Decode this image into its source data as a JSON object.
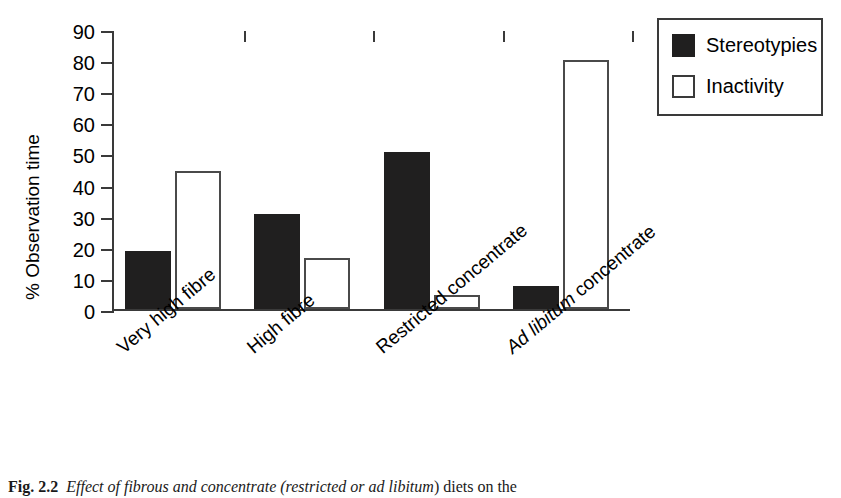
{
  "chart_data": {
    "type": "bar",
    "title": "",
    "xlabel": "",
    "ylabel": "% Observation time",
    "ylim": [
      0,
      90
    ],
    "yticks": [
      0,
      10,
      20,
      30,
      40,
      50,
      60,
      70,
      80,
      90
    ],
    "grid": false,
    "legend_position": "top-right",
    "categories": [
      "Very high fibre",
      "High fibre",
      "Restricted concentrate",
      "Ad libitum concentrate"
    ],
    "category_parts": [
      {
        "plain": "Very high fibre",
        "italic": ""
      },
      {
        "plain": "High fibre",
        "italic": ""
      },
      {
        "plain": "Restricted concentrate",
        "italic": ""
      },
      {
        "italic": "Ad libitum",
        "plain": " concentrate"
      }
    ],
    "series": [
      {
        "name": "Stereotypies",
        "values": [
          18.5,
          30.5,
          50.5,
          7.5
        ],
        "fill": "#201f1f"
      },
      {
        "name": "Inactivity",
        "values": [
          44.5,
          16.5,
          4.5,
          80.0
        ],
        "fill": "#ffffff"
      }
    ]
  },
  "legend": {
    "items": [
      {
        "label": "Stereotypies",
        "style": "filled"
      },
      {
        "label": "Inactivity",
        "style": "outline"
      }
    ]
  },
  "caption": {
    "figure_number": "Fig. 2.2",
    "text_before": "Effect of fibrous and concentrate (restricted or ",
    "text_italic": "ad libitum",
    "text_after": ") diets on the"
  },
  "colors": {
    "axis": "#3a3a3a",
    "stereotypies": "#201f1f",
    "inactivity": "#ffffff",
    "text": "#000000"
  }
}
